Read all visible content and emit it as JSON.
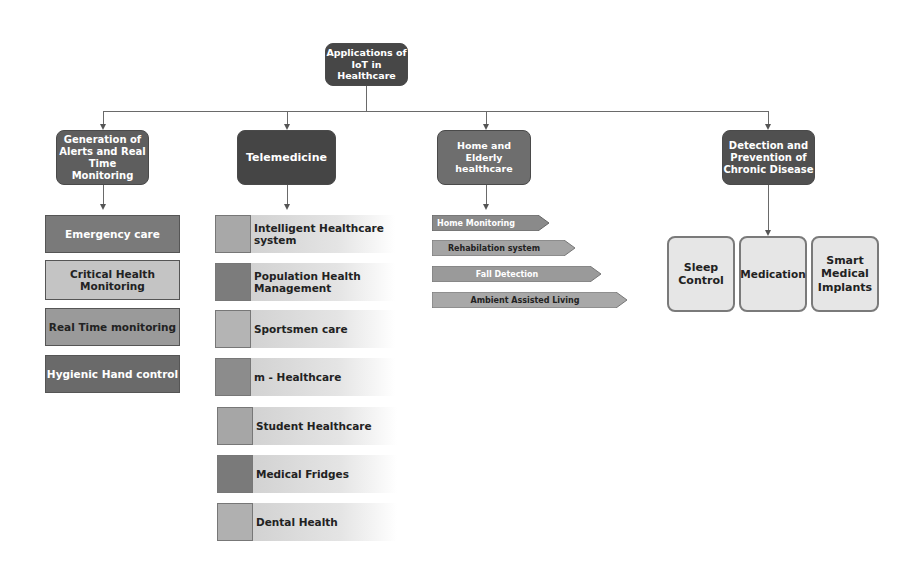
{
  "diagram": {
    "title": "Applications of IoT in Healthcare",
    "root": {
      "line1": "Applications of",
      "line2": "IoT in Healthcare"
    },
    "categories": [
      {
        "label_lines": [
          "Generation of",
          "Alerts and Real",
          "Time Monitoring"
        ],
        "items": [
          {
            "label": "Emergency care",
            "fill": "#7a7a7a",
            "text_color": "#ffffff"
          },
          {
            "label_lines": [
              "Critical Health",
              "Monitoring"
            ],
            "fill": "#c4c4c4",
            "text_color": "#222222"
          },
          {
            "label": "Real Time monitoring",
            "fill": "#9a9a9a",
            "text_color": "#222222"
          },
          {
            "label": "Hygienic Hand control",
            "fill": "#6a6a6a",
            "text_color": "#ffffff"
          }
        ]
      },
      {
        "label": "Telemedicine",
        "items": [
          {
            "label_lines": [
              "Intelligent Healthcare",
              "system"
            ],
            "square_fill": "#a8a8a8"
          },
          {
            "label_lines": [
              "Population Health",
              "Management"
            ],
            "square_fill": "#7c7c7c"
          },
          {
            "label": "Sportsmen care",
            "square_fill": "#b4b4b4"
          },
          {
            "label": "m - Healthcare",
            "square_fill": "#8c8c8c"
          },
          {
            "label": "Student Healthcare",
            "square_fill": "#a6a6a6"
          },
          {
            "label": "Medical Fridges",
            "square_fill": "#7a7a7a"
          },
          {
            "label": "Dental Health",
            "square_fill": "#b0b0b0"
          }
        ]
      },
      {
        "label_lines": [
          "Home and",
          "Elderly healthcare"
        ],
        "items": [
          {
            "label": "Home Monitoring",
            "fill": "#8a8a8a",
            "text_color": "#ffffff"
          },
          {
            "label": "Rehabilation system",
            "fill": "#a4a4a4",
            "text_color": "#222222"
          },
          {
            "label": "Fall Detection",
            "fill": "#9a9a9a",
            "text_color": "#ffffff"
          },
          {
            "label": "Ambient Assisted Living",
            "fill": "#a8a8a8",
            "text_color": "#222222"
          }
        ]
      },
      {
        "label_lines": [
          "Detection and",
          "Prevention of",
          "Chronic Disease"
        ],
        "items": [
          {
            "label_lines": [
              "Sleep",
              "Control"
            ]
          },
          {
            "label": "Medication"
          },
          {
            "label_lines": [
              "Smart",
              "Medical",
              "Implants"
            ]
          }
        ]
      }
    ]
  }
}
